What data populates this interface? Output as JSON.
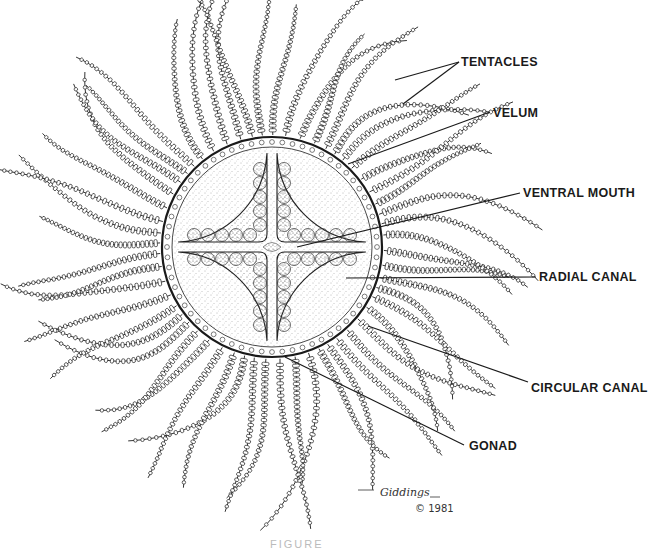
{
  "figure": {
    "bell": {
      "cx": 272,
      "cy": 247,
      "r": 110
    },
    "tentacle_count": 56,
    "colors": {
      "ink": "#1a1a1a",
      "stipple": "#555555",
      "background": "#ffffff"
    }
  },
  "labels": [
    {
      "id": "tentacles",
      "text": "TENTACLES",
      "x": 461,
      "y": 55,
      "lines": [
        [
          459,
          62,
          395,
          80
        ],
        [
          459,
          62,
          403,
          104
        ]
      ]
    },
    {
      "id": "velum",
      "text": "VELUM",
      "x": 493,
      "y": 106,
      "lines": [
        [
          490,
          112,
          348,
          164
        ]
      ]
    },
    {
      "id": "ventral-mouth",
      "text": "VENTRAL MOUTH",
      "x": 523,
      "y": 186,
      "lines": [
        [
          520,
          193,
          297,
          247
        ]
      ]
    },
    {
      "id": "radial-canal",
      "text": "RADIAL CANAL",
      "x": 539,
      "y": 270,
      "lines": [
        [
          536,
          277,
          346,
          278
        ]
      ]
    },
    {
      "id": "circular-canal",
      "text": "CIRCULAR CANAL",
      "x": 531,
      "y": 381,
      "lines": [
        [
          528,
          382,
          368,
          326
        ]
      ]
    },
    {
      "id": "gonad",
      "text": "GONAD",
      "x": 469,
      "y": 439,
      "lines": [
        [
          464,
          445,
          285,
          357
        ]
      ]
    }
  ],
  "signature": {
    "text": "Giddings",
    "initials": "J/D",
    "x": 380,
    "y": 486
  },
  "copyright": {
    "text": "© 1981",
    "x": 415,
    "y": 503
  },
  "caption": {
    "text": "FIGURE"
  }
}
